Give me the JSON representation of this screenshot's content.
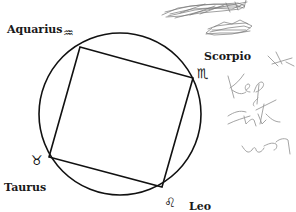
{
  "diagram": {
    "type": "zodiac-square-in-circle",
    "colors": {
      "line": "#111111",
      "scribble": "#8a8a8a",
      "scribble_dark": "#555555",
      "background": "#ffffff"
    },
    "circle": {
      "cx": 120,
      "cy": 114,
      "r": 81
    },
    "square": {
      "vertices": [
        {
          "sign": "Aquarius",
          "x": 80,
          "y": 47
        },
        {
          "sign": "Scorpio",
          "x": 193,
          "y": 78
        },
        {
          "sign": "Leo",
          "x": 162,
          "y": 187
        },
        {
          "sign": "Taurus",
          "x": 49,
          "y": 157
        }
      ]
    },
    "signs": [
      {
        "name": "Aquarius",
        "symbol": "♒",
        "symbol_name": "aquarius-icon"
      },
      {
        "name": "Scorpio",
        "symbol": "♏",
        "symbol_name": "scorpio-icon"
      },
      {
        "name": "Taurus",
        "symbol": "♉",
        "symbol_name": "taurus-icon"
      },
      {
        "name": "Leo",
        "symbol": "♌",
        "symbol_name": "leo-icon"
      }
    ],
    "annotations": {
      "handwriting_lines": [
        "Kep it",
        "that",
        "way"
      ]
    }
  }
}
